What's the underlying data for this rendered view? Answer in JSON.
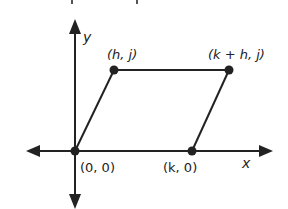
{
  "diagram": {
    "title_fragment_visible": true,
    "colors": {
      "stroke": "#222222",
      "background": "#ffffff"
    },
    "axes": {
      "x_label": "x",
      "y_label": "y"
    },
    "points": [
      {
        "id": "origin",
        "label": "(0, 0)",
        "px": [
          75,
          151
        ]
      },
      {
        "id": "k0",
        "label": "(k, 0)",
        "px": [
          192,
          151
        ]
      },
      {
        "id": "hj",
        "label": "(h, j)",
        "px": [
          114,
          70
        ]
      },
      {
        "id": "khj",
        "label": "(k + h, j)",
        "px": [
          229,
          70
        ]
      }
    ],
    "shape": "parallelogram"
  }
}
